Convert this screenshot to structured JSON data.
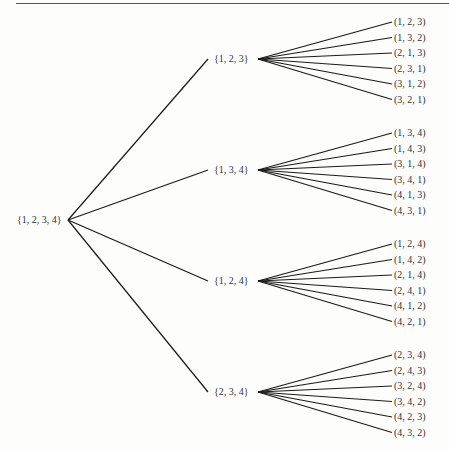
{
  "diagram": {
    "root": "{1, 2, 3, 4}",
    "subsets": [
      {
        "label": "{1, 2, 3}",
        "permutations": [
          "(1, 2, 3)",
          "(1, 3, 2)",
          "(2, 1, 3)",
          "(2, 3, 1)",
          "(3, 1, 2)",
          "(3, 2, 1)"
        ]
      },
      {
        "label": "{1, 3, 4}",
        "permutations": [
          "(1, 3, 4)",
          "(1, 4, 3)",
          "(3, 1, 4)",
          "(3, 4, 1)",
          "(4, 1, 3)",
          "(4, 3, 1)"
        ]
      },
      {
        "label": "{1, 2, 4}",
        "permutations": [
          "(1, 2, 4)",
          "(1, 4, 2)",
          "(2, 1, 4)",
          "(2, 4, 1)",
          "(4, 1, 2)",
          "(4, 2, 1)"
        ]
      },
      {
        "label": "{2, 3, 4}",
        "permutations": [
          "(2, 3, 4)",
          "(2, 4, 3)",
          "(3, 2, 4)",
          "(3, 4, 2)",
          "(4, 2, 3)",
          "(4, 3, 2)"
        ]
      }
    ]
  }
}
